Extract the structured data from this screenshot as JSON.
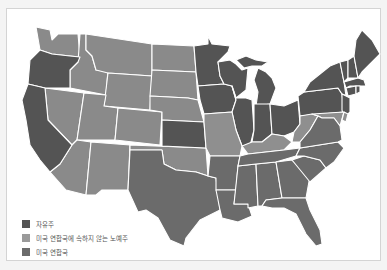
{
  "map": {
    "colors": {
      "free": "#545454",
      "border": "#8f8f8f",
      "confederate": "#6b6b6b",
      "territory": "#8a8a8a",
      "border_line": "#ffffff",
      "background": "#ffffff"
    }
  },
  "legend": {
    "items": [
      {
        "label": "자유주",
        "color": "#545454"
      },
      {
        "label": "미국 연합국에 속하지 않는 노예주",
        "color": "#9a9a9a"
      },
      {
        "label": "미국 연합국",
        "color": "#6b6b6b"
      }
    ]
  }
}
